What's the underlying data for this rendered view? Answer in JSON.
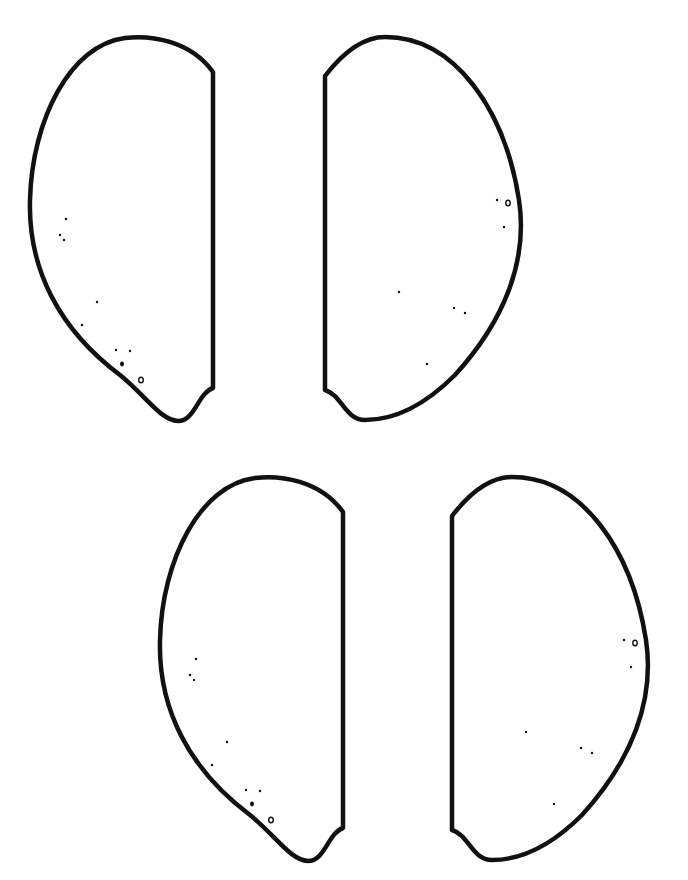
{
  "page": {
    "background": "#ffffff",
    "stroke_color": "#111111"
  },
  "shapes": [
    {
      "id": "top-left",
      "orientation": "flat-edge-right",
      "offset": [
        0,
        0
      ]
    },
    {
      "id": "top-right",
      "orientation": "flat-edge-left",
      "offset": [
        0,
        0
      ]
    },
    {
      "id": "bottom-left",
      "orientation": "flat-edge-right",
      "offset": [
        130,
        440
      ]
    },
    {
      "id": "bottom-right",
      "orientation": "flat-edge-left",
      "offset": [
        127,
        440
      ]
    }
  ]
}
